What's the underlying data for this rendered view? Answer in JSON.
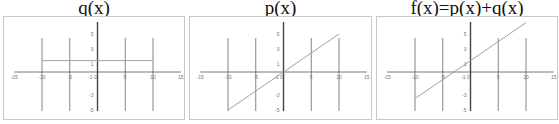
{
  "chart_data": [
    {
      "type": "line",
      "title": "q(x)",
      "xlabel": "",
      "ylabel": "",
      "xlim": [
        -15,
        15
      ],
      "ylim": [
        -5,
        5
      ],
      "x_ticks": [
        "-15",
        "-10",
        "-5",
        "0",
        "5",
        "10",
        "15"
      ],
      "y_ticks": [
        "5",
        "3",
        "1",
        "-1",
        "-3",
        "-5"
      ],
      "vertical_gridlines_at": [
        -10,
        -5,
        0,
        5,
        10
      ],
      "grid": true,
      "series": [
        {
          "name": "q(x)",
          "x": [
            -10,
            10
          ],
          "y": [
            1.5,
            1.5
          ]
        }
      ]
    },
    {
      "type": "line",
      "title": "p(x)",
      "xlabel": "",
      "ylabel": "",
      "xlim": [
        -15,
        15
      ],
      "ylim": [
        -5,
        5
      ],
      "x_ticks": [
        "-15",
        "-10",
        "-5",
        "0",
        "5",
        "10",
        "15"
      ],
      "y_ticks": [
        "5",
        "3",
        "1",
        "-1",
        "-3",
        "-5"
      ],
      "vertical_gridlines_at": [
        -10,
        -5,
        0,
        5,
        10
      ],
      "grid": true,
      "series": [
        {
          "name": "p(x)",
          "x": [
            -10,
            10
          ],
          "y": [
            -5,
            5
          ]
        }
      ]
    },
    {
      "type": "line",
      "title": "f(x)=p(x)+q(x)",
      "xlabel": "",
      "ylabel": "",
      "xlim": [
        -15,
        15
      ],
      "ylim": [
        -5,
        5
      ],
      "x_ticks": [
        "-15",
        "-10",
        "-5",
        "0",
        "5",
        "10",
        "15"
      ],
      "y_ticks": [
        "5",
        "3",
        "1",
        "-1",
        "-3",
        "-5"
      ],
      "vertical_gridlines_at": [
        -10,
        -5,
        0,
        5,
        10
      ],
      "grid": true,
      "series": [
        {
          "name": "f(x)",
          "x": [
            -10,
            10
          ],
          "y": [
            -3.5,
            6.5
          ]
        }
      ]
    }
  ],
  "panels": [
    {
      "title": "q(x)"
    },
    {
      "title": "p(x)"
    },
    {
      "title": "f(x)=p(x)+q(x)"
    }
  ],
  "colors": {
    "axis": "#555555",
    "grid": "#666666",
    "line": "#a0a0a0",
    "frame": "#c8c8c8"
  }
}
